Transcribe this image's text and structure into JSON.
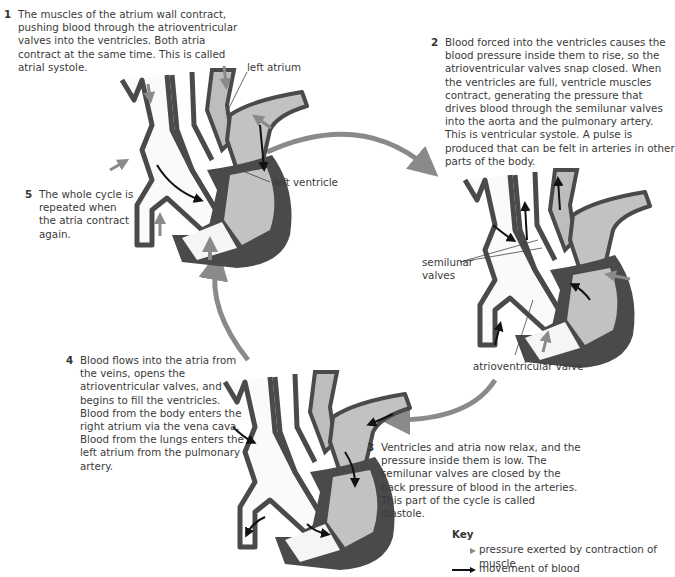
{
  "steps": [
    {
      "number": "1",
      "text": "The muscles of the atrium wall contract, pushing blood through the atrioventricular valves into the ventricles. Both atria contract at the same time. This is called atrial systole."
    },
    {
      "number": "2",
      "text": "Blood forced into the ventricles causes the blood pressure inside them to rise, so the atrioventricular valves snap closed. When the ventricles are full, ventricle muscles contract, generating the pressure that drives blood through the semilunar valves into the aorta and the pulmonary artery. This is ventricular systole. A pulse is produced that can be felt in arteries in other parts of the body."
    },
    {
      "number": "3",
      "text": "Ventricles and atria now relax, and the pressure inside them is low. The semilunar valves are closed by the back pressure of blood in the arteries. This part of the cycle is called diastole."
    },
    {
      "number": "4",
      "text": "Blood flows into the atria from the veins, opens the atrioventricular valves, and begins to fill the ventricles.",
      "text2": "Blood from the body enters the right atrium via the vena cava. Blood from the lungs enters the left atrium from the pulmonary artery."
    },
    {
      "number": "5",
      "text": "The whole cycle is repeated when the atria contract again."
    }
  ],
  "labels": {
    "left_atrium": "left atrium",
    "left_ventricle": "left ventricle",
    "semilunar_valves_1": "semilunar",
    "semilunar_valves_2": "valves",
    "atrioventricular_valve": "atrioventricular valve"
  },
  "key": {
    "title": "Key",
    "items": [
      {
        "symbol": "grey-arrow",
        "label": "pressure exerted by contraction of muscle"
      },
      {
        "symbol": "black-arrow",
        "label": "movement of blood"
      }
    ]
  },
  "colors": {
    "cycle_arrow": "#8a8a8a",
    "heart_wall": "#4a4a4a",
    "chamber_fill": "#bdbdbd",
    "blood_arrow": "#111111"
  }
}
